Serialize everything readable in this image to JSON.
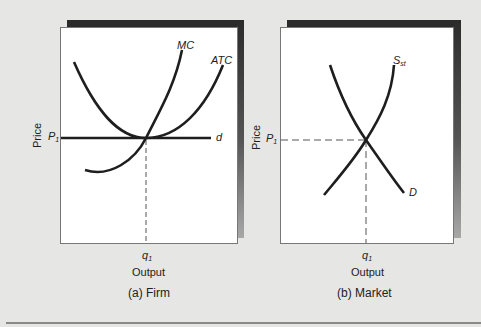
{
  "colors": {
    "background": "#e6e6e4",
    "panel": "#ffffff",
    "shadow_dark": "#2b2b2b",
    "curve": "#1e1e1e",
    "dashed": "#555555"
  },
  "panels": [
    {
      "id": "firm",
      "caption": "(a) Firm",
      "y_axis_label": "Price",
      "x_axis_label": "Output",
      "price_tick": "P",
      "price_tick_sub": "1",
      "qty_tick": "q",
      "qty_tick_sub": "1",
      "curves": [
        {
          "name": "MC",
          "label": "MC"
        },
        {
          "name": "ATC",
          "label": "ATC"
        },
        {
          "name": "d",
          "label": "d"
        }
      ]
    },
    {
      "id": "market",
      "caption": "(b) Market",
      "y_axis_label": "Price",
      "x_axis_label": "Output",
      "price_tick": "P",
      "price_tick_sub": "1",
      "qty_tick": "q",
      "qty_tick_sub": "1",
      "curves": [
        {
          "name": "S_st",
          "label": "S",
          "label_sub": "st"
        },
        {
          "name": "D",
          "label": "D"
        }
      ]
    }
  ]
}
